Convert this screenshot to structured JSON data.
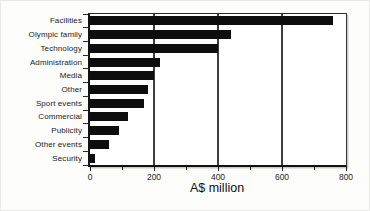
{
  "chart_data": {
    "type": "bar",
    "orientation": "horizontal",
    "title": "",
    "xlabel": "A$ million",
    "ylabel": "",
    "categories": [
      "Facilities",
      "Olympic family",
      "Technology",
      "Administration",
      "Media",
      "Other",
      "Sport events",
      "Commercial",
      "Publicity",
      "Other events",
      "Security"
    ],
    "values": [
      760,
      440,
      400,
      220,
      200,
      180,
      170,
      120,
      90,
      60,
      15
    ],
    "xlim": [
      0,
      800
    ],
    "x_major_ticks": [
      0,
      200,
      400,
      600,
      800
    ],
    "x_minor_ticks": [
      100,
      300,
      500,
      700
    ],
    "gridline_values": [
      200,
      400,
      600
    ],
    "grid_on": true,
    "legend": "none",
    "bar_color": "#0d0d0d",
    "grid_color": "#3d3d3d",
    "background_color": "#ffffff"
  }
}
